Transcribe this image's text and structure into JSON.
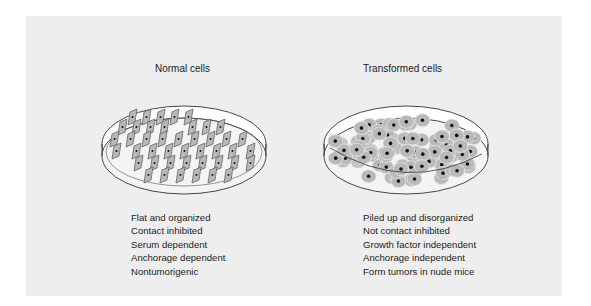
{
  "figure": {
    "background_color": "#eeeeee",
    "panels": [
      {
        "title": "Normal cells",
        "properties": [
          "Flat and organized",
          "Contact inhibited",
          "Serum dependent",
          "Anchorage dependent",
          "Nontumorigenic"
        ],
        "cell_style": "flat rhomboid cells in regular rows, each with a central nucleus"
      },
      {
        "title": "Transformed cells",
        "properties": [
          "Piled up and disorganized",
          "Not contact inhibited",
          "Growth factor independent",
          "Anchorage independent",
          "Form tumors in nude mice"
        ],
        "cell_style": "rounded overlapping cells piled up, each with a dark nucleus"
      }
    ],
    "colors": {
      "cell_fill": "#b9b9b9",
      "cell_outline": "#555555",
      "nucleus": "#111111",
      "dish_outline": "#333333",
      "dish_fill": "#ffffff"
    }
  }
}
